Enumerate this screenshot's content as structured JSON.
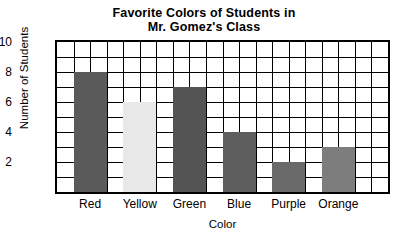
{
  "chart_data": {
    "type": "bar",
    "title": "Favorite Colors of Students in Mr. Gomez's Class",
    "title_lines": [
      "Favorite Colors of Students in",
      "Mr. Gomez's Class"
    ],
    "xlabel": "Color",
    "ylabel": "Number of Students",
    "categories": [
      "Red",
      "Yellow",
      "Green",
      "Blue",
      "Purple",
      "Orange"
    ],
    "values": [
      8,
      6,
      7,
      4,
      2,
      3
    ],
    "ylim": [
      0,
      10
    ],
    "ytick_labels": [
      "2",
      "4",
      "6",
      "8",
      "10"
    ],
    "ytick_values": [
      2,
      4,
      6,
      8,
      10
    ],
    "y_minor_step": 1,
    "grid": true,
    "grid_columns": 20,
    "grid_rows": 10,
    "legend": "none",
    "bar_colors": [
      "#5a5a5a",
      "#e8e8e8",
      "#545454",
      "#5e5e5e",
      "#6a6a6a",
      "#7d7d7d"
    ],
    "frame_color": "#000000",
    "background": "#ffffff"
  }
}
